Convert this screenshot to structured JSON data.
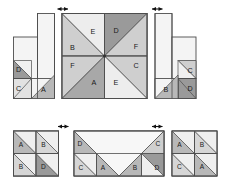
{
  "figure": {
    "background": "#ffffff",
    "width": 226,
    "height": 185
  },
  "palette": {
    "dark": "#9a9a9a",
    "medium": "#bdbdbd",
    "light": "#d8d8d8",
    "pale": "#ededed",
    "white": "#f7f7f7",
    "stroke": "#4d4d4d",
    "thin_stroke": "#6b6b6b",
    "label_color": "#1a1a1a",
    "arrow_color": "#111111"
  },
  "panels": {
    "top_left": {
      "name": "top-left-net",
      "labels": [
        {
          "text": "D",
          "shade": "dark"
        },
        {
          "text": "C",
          "shade": "light"
        },
        {
          "text": "A",
          "shade": "medium"
        }
      ]
    },
    "center": {
      "name": "center-pinwheel",
      "labels": [
        {
          "text": "E",
          "shade": "pale",
          "position": "top-right-of-top-left-quadrant"
        },
        {
          "text": "D",
          "shade": "dark",
          "position": "top-left-of-top-right-quadrant"
        },
        {
          "text": "B",
          "shade": "light",
          "position": "bottom-left-of-top-left-quadrant"
        },
        {
          "text": "F",
          "shade": "light",
          "position": "bottom-right-of-top-right-quadrant"
        },
        {
          "text": "F",
          "shade": "light",
          "position": "top-left-of-bottom-left-quadrant"
        },
        {
          "text": "C",
          "shade": "light",
          "position": "top-right-of-bottom-right-quadrant"
        },
        {
          "text": "A",
          "shade": "dark",
          "position": "bottom-right-of-bottom-left-quadrant"
        },
        {
          "text": "E",
          "shade": "pale",
          "position": "bottom-left-of-bottom-right-quadrant"
        }
      ]
    },
    "top_right": {
      "name": "top-right-net",
      "labels": [
        {
          "text": "C",
          "shade": "light"
        },
        {
          "text": "B",
          "shade": "medium"
        },
        {
          "text": "D",
          "shade": "dark"
        }
      ]
    },
    "bottom_left": {
      "name": "bottom-left-grid",
      "rows": [
        [
          {
            "text": "A",
            "shade": "medium"
          },
          {
            "text": "B",
            "shade": "light"
          }
        ],
        [
          {
            "text": "B",
            "shade": "light"
          },
          {
            "text": "D",
            "shade": "dark"
          }
        ]
      ]
    },
    "bottom_center": {
      "name": "bottom-center-net",
      "labels": [
        {
          "text": "D",
          "shade": "medium"
        },
        {
          "text": "C",
          "shade": "light"
        },
        {
          "text": "C",
          "shade": "light"
        },
        {
          "text": "A",
          "shade": "medium"
        },
        {
          "text": "B",
          "shade": "medium"
        },
        {
          "text": "D",
          "shade": "dark"
        }
      ]
    },
    "bottom_right": {
      "name": "bottom-right-grid",
      "rows": [
        [
          {
            "text": "A",
            "shade": "medium"
          },
          {
            "text": "B",
            "shade": "light"
          }
        ],
        [
          {
            "text": "C",
            "shade": "light"
          },
          {
            "text": "A",
            "shade": "medium"
          }
        ]
      ]
    }
  },
  "arrows": [
    {
      "name": "arrow-top-left",
      "label": "",
      "direction": "double-horizontal"
    },
    {
      "name": "arrow-top-right",
      "label": "",
      "direction": "double-horizontal"
    },
    {
      "name": "arrow-bottom-left",
      "label": "",
      "direction": "double-horizontal"
    },
    {
      "name": "arrow-bottom-right",
      "label": "",
      "direction": "double-horizontal"
    }
  ],
  "text": {
    "A": "A",
    "B": "B",
    "C": "C",
    "D": "D",
    "E": "E",
    "F": "F"
  }
}
